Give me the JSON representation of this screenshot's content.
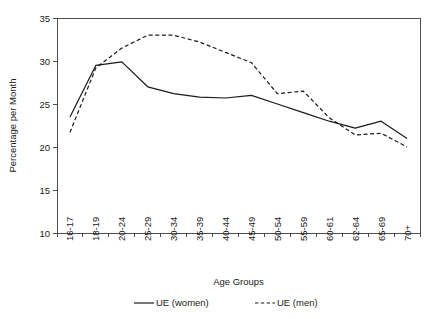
{
  "chart_data": {
    "type": "line",
    "title": "",
    "xlabel": "Age Groups",
    "ylabel": "Percentage per Month",
    "categories": [
      "16-17",
      "18-19",
      "20-24",
      "25-29",
      "30-34",
      "35-39",
      "40-44",
      "45-49",
      "50-54",
      "55-59",
      "60-61",
      "62-64",
      "65-69",
      "70+"
    ],
    "ylim": [
      10,
      35
    ],
    "yticks": [
      10,
      15,
      20,
      25,
      30,
      35
    ],
    "ytick_labels": [
      "10",
      "15",
      "20",
      "25",
      "30",
      "35"
    ],
    "grid": false,
    "legend_position": "bottom",
    "series": [
      {
        "name": "UE (women)",
        "style": "solid",
        "color": "#1a1a1a",
        "values": [
          23.5,
          29.5,
          29.9,
          27.0,
          26.2,
          25.8,
          25.7,
          26.0,
          25.0,
          24.0,
          23.0,
          22.2,
          23.0,
          21.0
        ]
      },
      {
        "name": "UE (men)",
        "style": "dashed",
        "color": "#1a1a1a",
        "values": [
          21.7,
          29.2,
          31.5,
          33.0,
          33.0,
          32.2,
          31.0,
          29.8,
          26.2,
          26.5,
          23.4,
          21.4,
          21.6,
          20.0
        ]
      }
    ]
  },
  "legend": {
    "items": [
      {
        "label": "UE (women)"
      },
      {
        "label": "UE (men)"
      }
    ]
  }
}
